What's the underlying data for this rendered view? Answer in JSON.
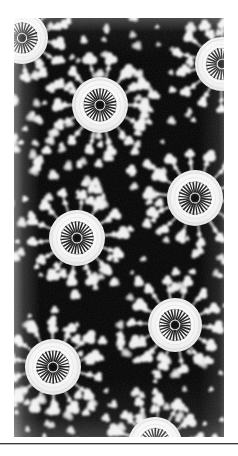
{
  "page": {
    "background_color": "#ffffff",
    "width": 238,
    "height": 456,
    "caption": ""
  },
  "plate": {
    "name": "crochet-lace-photograph",
    "description": "Black and white photographic plate of handmade crocheted lace fabric",
    "x": 14,
    "y": 18,
    "width": 210,
    "height": 419,
    "background_color": "#0a0a0a",
    "thread_color": "#f4f4f4",
    "shadow_color": "#8d8d8d",
    "tone": "monochrome"
  },
  "footer_rule": {
    "color": "#3c3c3c",
    "highlight_color": "#b8b8b8",
    "y": 443,
    "thickness": 1
  },
  "pattern": {
    "motif_count": 8,
    "lattice_mesh_color": "#ededed",
    "void_color": "#050505",
    "motifs": [
      {
        "label": "motif-top-left-partial",
        "cx": 8,
        "cy": 20,
        "disc_r": 26,
        "ring_r": 13,
        "core_r": 4.2,
        "spokes": 26,
        "rotation": 8
      },
      {
        "label": "motif-upper-center",
        "cx": 86,
        "cy": 87,
        "disc_r": 28,
        "ring_r": 14,
        "core_r": 4.6,
        "spokes": 28,
        "rotation": 0
      },
      {
        "label": "motif-upper-right",
        "cx": 208,
        "cy": 46,
        "disc_r": 27,
        "ring_r": 13.5,
        "core_r": 4.4,
        "spokes": 27,
        "rotation": 14
      },
      {
        "label": "motif-mid-right",
        "cx": 181,
        "cy": 180,
        "disc_r": 28,
        "ring_r": 14,
        "core_r": 4.5,
        "spokes": 28,
        "rotation": 6
      },
      {
        "label": "motif-mid-left",
        "cx": 63,
        "cy": 220,
        "disc_r": 28,
        "ring_r": 14,
        "core_r": 4.6,
        "spokes": 28,
        "rotation": 20
      },
      {
        "label": "motif-lower-right",
        "cx": 161,
        "cy": 307,
        "disc_r": 27,
        "ring_r": 13.5,
        "core_r": 4.4,
        "spokes": 27,
        "rotation": 3
      },
      {
        "label": "motif-lower-left",
        "cx": 39,
        "cy": 349,
        "disc_r": 28,
        "ring_r": 14,
        "core_r": 4.6,
        "spokes": 28,
        "rotation": 12
      },
      {
        "label": "motif-bottom-partial",
        "cx": 141,
        "cy": 426,
        "disc_r": 27,
        "ring_r": 13.5,
        "core_r": 4.4,
        "spokes": 27,
        "rotation": 18
      }
    ],
    "mesh_nodes_per_motif": 14,
    "mesh_ring_radius_factor": 1.58,
    "picot_cluster_radius": 4.2
  }
}
